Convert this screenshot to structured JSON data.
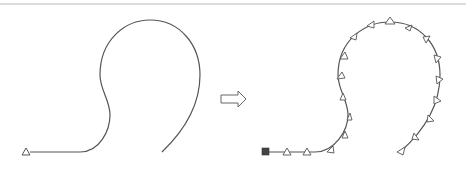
{
  "diagram": {
    "colors": {
      "stroke": "#555555",
      "marker_fill": "#ffffff",
      "start_marker_fill": "#444444",
      "top_rule": "#dcdcdc"
    },
    "left_panel": {
      "label": "",
      "start_marker": "triangle-outline"
    },
    "transition_arrow": {
      "icon": "hollow-right-arrow"
    },
    "right_panel": {
      "label": "",
      "start_marker": "filled-square-robot",
      "marker_count": 20,
      "marker_shape": "triangle-outline-oriented-along-path"
    }
  }
}
